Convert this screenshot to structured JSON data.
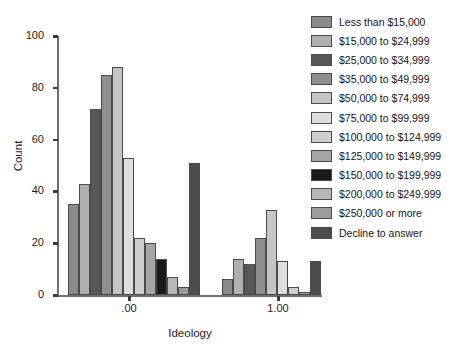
{
  "chart_data": {
    "type": "bar",
    "title": "",
    "xlabel": "Ideology",
    "ylabel": "Count",
    "ylim": [
      0,
      100
    ],
    "y_ticks": [
      0,
      20,
      40,
      60,
      80,
      100
    ],
    "y_tick_labels": [
      "0",
      "20",
      "40",
      "60",
      "80",
      "100"
    ],
    "x_tick_labels": [
      ".00",
      "1.00"
    ],
    "x_tick_values": [
      0.0,
      1.0
    ],
    "grid": false,
    "legend_position": "right",
    "legend_title": "",
    "categories": [
      "Less than $15,000",
      "$15,000 to $24,999",
      "$25,000 to $34,999",
      "$35,000 to $49,999",
      "$50,000 to $74,999",
      "$75,000 to $99,999",
      "$100,000 to $124,999",
      "$125,000 to $149,999",
      "$150,000 to $199,999",
      "$200,000 to $249,999",
      "$250,000 or more",
      "Decline to answer"
    ],
    "colors": [
      "#8a8a8a",
      "#b0b0b0",
      "#585858",
      "#8f8f8f",
      "#c5c5c5",
      "#dedede",
      "#cfcfcf",
      "#a6a6a6",
      "#1a1a1a",
      "#b8b8b8",
      "#9b9b9b",
      "#4d4d4d"
    ],
    "groups": [
      {
        "name": "ideology-low",
        "bars": [
          {
            "category": "Less than $15,000",
            "value": 35,
            "color": "#8a8a8a",
            "x": 68,
            "w": 11
          },
          {
            "category": "$15,000 to $24,999",
            "value": 43,
            "color": "#b0b0b0",
            "x": 79,
            "w": 11
          },
          {
            "category": "$25,000 to $34,999",
            "value": 72,
            "color": "#585858",
            "x": 90,
            "w": 11
          },
          {
            "category": "$35,000 to $49,999",
            "value": 85,
            "color": "#8f8f8f",
            "x": 101,
            "w": 11
          },
          {
            "category": "$50,000 to $74,999",
            "value": 88,
            "color": "#c5c5c5",
            "x": 112,
            "w": 11
          },
          {
            "category": "$75,000 to $99,999",
            "value": 53,
            "color": "#dedede",
            "x": 123,
            "w": 11
          },
          {
            "category": "$100,000 to $124,999",
            "value": 22,
            "color": "#cfcfcf",
            "x": 134,
            "w": 11
          },
          {
            "category": "$125,000 to $149,999",
            "value": 20,
            "color": "#a6a6a6",
            "x": 145,
            "w": 11
          },
          {
            "category": "$150,000 to $199,999",
            "value": 14,
            "color": "#1a1a1a",
            "x": 156,
            "w": 11
          },
          {
            "category": "$200,000 to $249,999",
            "value": 7,
            "color": "#b8b8b8",
            "x": 167,
            "w": 11
          },
          {
            "category": "$250,000 or more",
            "value": 3,
            "color": "#9b9b9b",
            "x": 178,
            "w": 11
          },
          {
            "category": "Decline to answer",
            "value": 51,
            "color": "#4d4d4d",
            "x": 189,
            "w": 11
          }
        ]
      },
      {
        "name": "ideology-high",
        "bars": [
          {
            "category": "Less than $15,000",
            "value": 6,
            "color": "#8a8a8a",
            "x": 222,
            "w": 11
          },
          {
            "category": "$15,000 to $24,999",
            "value": 14,
            "color": "#b0b0b0",
            "x": 233,
            "w": 11
          },
          {
            "category": "$25,000 to $34,999",
            "value": 12,
            "color": "#585858",
            "x": 244,
            "w": 11
          },
          {
            "category": "$35,000 to $49,999",
            "value": 22,
            "color": "#8f8f8f",
            "x": 255,
            "w": 11
          },
          {
            "category": "$50,000 to $74,999",
            "value": 33,
            "color": "#c5c5c5",
            "x": 266,
            "w": 11
          },
          {
            "category": "$75,000 to $99,999",
            "value": 13,
            "color": "#dedede",
            "x": 277,
            "w": 11
          },
          {
            "category": "$100,000 to $124,999",
            "value": 3,
            "color": "#cfcfcf",
            "x": 288,
            "w": 11
          },
          {
            "category": "$125,000 to $149,999",
            "value": 1,
            "color": "#a6a6a6",
            "x": 299,
            "w": 11
          },
          {
            "category": "Decline to answer",
            "value": 13,
            "color": "#4d4d4d",
            "x": 310,
            "w": 11
          }
        ]
      }
    ]
  }
}
